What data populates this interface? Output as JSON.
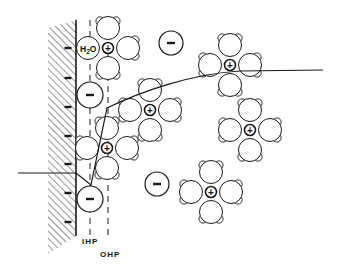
{
  "diagram": {
    "title": "Electrical double layer model",
    "colors": {
      "ink": "#1a1a1a",
      "background": "#ffffff"
    },
    "electrode": {
      "x": 76,
      "y_top": 20,
      "y_bottom": 236,
      "hatch_left": 48,
      "hatch_bottom": 254
    },
    "electrode_charges": [
      {
        "x": 68,
        "y": 48,
        "sign": "-"
      },
      {
        "x": 68,
        "y": 78,
        "sign": "-"
      },
      {
        "x": 68,
        "y": 107,
        "sign": "-"
      },
      {
        "x": 68,
        "y": 136,
        "sign": "-"
      },
      {
        "x": 68,
        "y": 164,
        "sign": "-"
      },
      {
        "x": 68,
        "y": 193,
        "sign": "-"
      },
      {
        "x": 68,
        "y": 222,
        "sign": "-"
      }
    ],
    "planes": [
      {
        "name": "IHP",
        "label": "IHP",
        "x": 90,
        "y_top": 20,
        "y_bottom": 235,
        "label_x": 82,
        "label_y": 244
      },
      {
        "name": "OHP",
        "label": "OHP",
        "x": 108,
        "y_top": 20,
        "y_bottom": 235,
        "label_x": 100,
        "label_y": 257
      }
    ],
    "water_label": {
      "text": "H2O",
      "main": "H",
      "sub": "2",
      "tail": "O",
      "x": 88,
      "y": 48
    },
    "anions": [
      {
        "x": 171,
        "y": 43,
        "r": 12,
        "sign": "−"
      },
      {
        "x": 90,
        "y": 95,
        "r": 13,
        "sign": "−"
      },
      {
        "x": 90,
        "y": 199,
        "r": 13,
        "sign": "−"
      },
      {
        "x": 157,
        "y": 184,
        "r": 12,
        "sign": "−"
      }
    ],
    "solvated_cations": [
      {
        "x": 108,
        "y": 48,
        "sign": "+"
      },
      {
        "x": 150,
        "y": 110,
        "sign": "+"
      },
      {
        "x": 230,
        "y": 65,
        "sign": "+"
      },
      {
        "x": 250,
        "y": 130,
        "sign": "+"
      },
      {
        "x": 107,
        "y": 148,
        "sign": "+"
      },
      {
        "x": 211,
        "y": 192,
        "sign": "+"
      }
    ],
    "potential_curve": {
      "axis_start_x": 18,
      "axis_y": 173,
      "points": "76,173 91,185 107,108 C 140,92 190,74 240,71 L 323,70"
    }
  }
}
